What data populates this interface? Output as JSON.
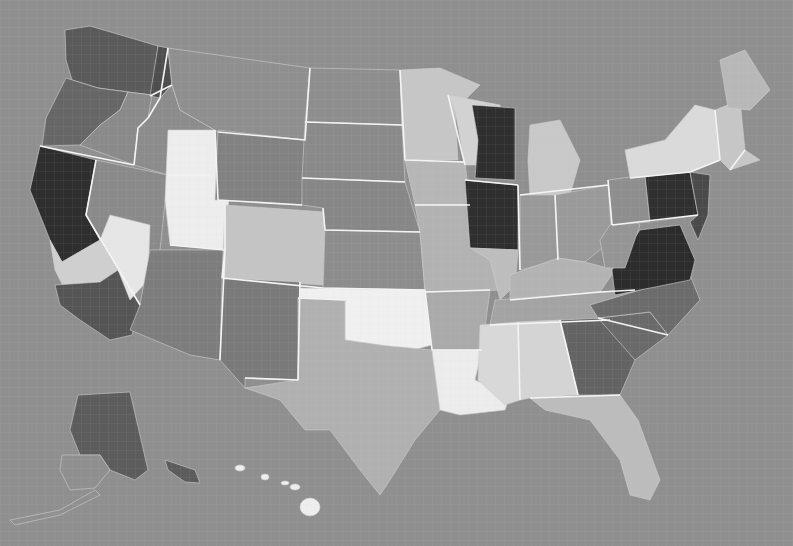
{
  "map": {
    "type": "choropleth",
    "subject": "United States counties",
    "background_color": "#8f8f8f",
    "border_color": "#f4f4f4",
    "shade_scale": [
      "#f2f2f2",
      "#d6d6d6",
      "#b4b4b4",
      "#8a8a8a",
      "#6c6c6c",
      "#4e4e4e",
      "#2e2e2e"
    ],
    "regions": [
      {
        "id": "WA",
        "shade": "#5a5a5a"
      },
      {
        "id": "OR-west",
        "shade": "#666666"
      },
      {
        "id": "OR-east",
        "shade": "#8a8a8a"
      },
      {
        "id": "CA-north",
        "shade": "#2e2e2e"
      },
      {
        "id": "CA-central",
        "shade": "#cfcfcf"
      },
      {
        "id": "CA-south",
        "shade": "#555555"
      },
      {
        "id": "NV",
        "shade": "#8a8a8a"
      },
      {
        "id": "NV-west",
        "shade": "#e6e6e6"
      },
      {
        "id": "ID",
        "shade": "#8c8c8c"
      },
      {
        "id": "ID-north",
        "shade": "#4e4e4e"
      },
      {
        "id": "MT",
        "shade": "#8f8f8f"
      },
      {
        "id": "UT",
        "shade": "#ededed"
      },
      {
        "id": "WY",
        "shade": "#828282"
      },
      {
        "id": "AZ",
        "shade": "#7d7d7d"
      },
      {
        "id": "CO",
        "shade": "#c4c4c4"
      },
      {
        "id": "NM",
        "shade": "#7a7a7a"
      },
      {
        "id": "ND",
        "shade": "#8e8e8e"
      },
      {
        "id": "SD",
        "shade": "#8a8a8a"
      },
      {
        "id": "NE",
        "shade": "#878787"
      },
      {
        "id": "KS",
        "shade": "#8d8d8d"
      },
      {
        "id": "OK",
        "shade": "#f0f0f0"
      },
      {
        "id": "TX",
        "shade": "#b0b0b0"
      },
      {
        "id": "MN",
        "shade": "#c6c6c6"
      },
      {
        "id": "IA",
        "shade": "#b6b6b6"
      },
      {
        "id": "MO",
        "shade": "#b2b2b2"
      },
      {
        "id": "AR",
        "shade": "#aaaaaa"
      },
      {
        "id": "LA",
        "shade": "#ececec"
      },
      {
        "id": "WI",
        "shade": "#d2d2d2"
      },
      {
        "id": "WI-east",
        "shade": "#2f2f2f"
      },
      {
        "id": "IL-north",
        "shade": "#2f2f2f"
      },
      {
        "id": "IL-south",
        "shade": "#bdbdbd"
      },
      {
        "id": "MI",
        "shade": "#c8c8c8"
      },
      {
        "id": "IN",
        "shade": "#999999"
      },
      {
        "id": "OH",
        "shade": "#9a9a9a"
      },
      {
        "id": "KY",
        "shade": "#b3b3b3"
      },
      {
        "id": "TN",
        "shade": "#a3a3a3"
      },
      {
        "id": "MS",
        "shade": "#d8d8d8"
      },
      {
        "id": "AL",
        "shade": "#d4d4d4"
      },
      {
        "id": "GA",
        "shade": "#636363"
      },
      {
        "id": "FL",
        "shade": "#bcbcbc"
      },
      {
        "id": "SC",
        "shade": "#6a6a6a"
      },
      {
        "id": "NC",
        "shade": "#6c6c6c"
      },
      {
        "id": "VA",
        "shade": "#2c2c2c"
      },
      {
        "id": "WV",
        "shade": "#959595"
      },
      {
        "id": "PA-west",
        "shade": "#8e8e8e"
      },
      {
        "id": "PA-east",
        "shade": "#303030"
      },
      {
        "id": "NY",
        "shade": "#dadada"
      },
      {
        "id": "NJ-MD-DE",
        "shade": "#4a4a4a"
      },
      {
        "id": "NewEngland",
        "shade": "#c6c6c6"
      },
      {
        "id": "ME",
        "shade": "#b8b8b8"
      },
      {
        "id": "AK",
        "shade": "#5c5c5c"
      },
      {
        "id": "AK-southwest",
        "shade": "#8f8f8f"
      },
      {
        "id": "HI",
        "shade": "#eeeeee"
      }
    ]
  }
}
